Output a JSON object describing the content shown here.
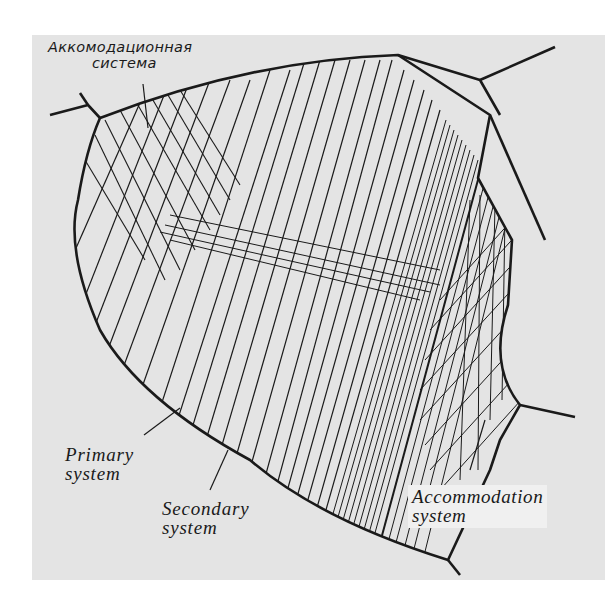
{
  "figure": {
    "background": "#e4e4e4",
    "ink": "#1a1a1a"
  },
  "labels": {
    "russian": {
      "line1": "Аккомодационная",
      "line2": "система"
    },
    "primary": {
      "line1": "Primary",
      "line2": "system"
    },
    "secondary": {
      "line1": "Secondary",
      "line2": "system"
    },
    "accommodation": {
      "line1": "Accommodation",
      "line2": "system"
    }
  }
}
